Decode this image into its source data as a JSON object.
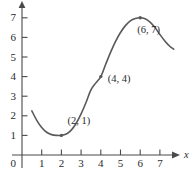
{
  "chart_data": {
    "type": "line",
    "title": "",
    "subtitle": "",
    "xlabel": "x",
    "ylabel": "",
    "xlim": [
      0,
      7.8
    ],
    "ylim": [
      0,
      7.6
    ],
    "grid": false,
    "legend": null,
    "x_ticks": [
      "1",
      "2",
      "3",
      "4",
      "5",
      "6",
      "7"
    ],
    "x_tick_values": [
      1,
      2,
      3,
      4,
      5,
      6,
      7
    ],
    "y_ticks": [
      "1",
      "2",
      "3",
      "4",
      "5",
      "6",
      "7"
    ],
    "y_tick_values": [
      1,
      2,
      3,
      4,
      5,
      6,
      7
    ],
    "origin_label": "0",
    "x_axis_arrow_label": "x",
    "curve_color": "#595959",
    "axis_color": "#4a4a4a",
    "series": [
      {
        "name": "curve",
        "x": [
          0.5,
          0.75,
          1.0,
          1.25,
          1.5,
          1.75,
          2.0,
          2.25,
          2.5,
          2.75,
          3.0,
          3.25,
          3.5,
          3.75,
          4.0,
          4.25,
          4.5,
          4.75,
          5.0,
          5.25,
          5.5,
          5.75,
          6.0,
          6.25,
          6.5,
          6.75,
          7.0,
          7.25,
          7.5,
          7.7
        ],
        "y": [
          2.25,
          1.77,
          1.4,
          1.16,
          1.04,
          1.0,
          1.0,
          1.07,
          1.27,
          1.62,
          2.1,
          2.68,
          3.32,
          3.68,
          4.0,
          4.63,
          5.25,
          5.8,
          6.25,
          6.6,
          6.84,
          6.96,
          7.0,
          6.95,
          6.78,
          6.5,
          6.15,
          5.82,
          5.55,
          5.4
        ]
      }
    ],
    "annotated_points": [
      {
        "name": "local-minimum",
        "label": "(2, 1)",
        "x": 2,
        "y": 1,
        "label_dx": 6,
        "label_dy": -14
      },
      {
        "name": "inflection-point",
        "label": "(4, 4)",
        "x": 4,
        "y": 4,
        "label_dx": 7,
        "label_dy": 2
      },
      {
        "name": "local-maximum",
        "label": "(6, 7)",
        "x": 6,
        "y": 7,
        "label_dx": -3,
        "label_dy": 12
      }
    ]
  }
}
